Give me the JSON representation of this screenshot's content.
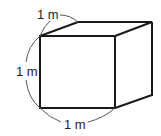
{
  "figure": {
    "type": "cube",
    "labels": {
      "top": "1 m",
      "left": "1 m",
      "bottom": "1 m"
    },
    "colors": {
      "stroke": "#1a1a1a",
      "background": "#ffffff"
    }
  }
}
